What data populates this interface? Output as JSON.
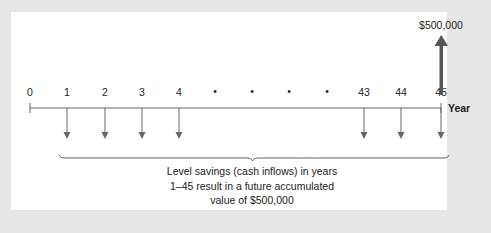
{
  "diagram": {
    "type": "cash-flow-timeline",
    "axis_label": "Year",
    "ticks": [
      {
        "label": "0",
        "x": 30,
        "kind": "number",
        "arrow": "none"
      },
      {
        "label": "1",
        "x": 67,
        "kind": "number",
        "arrow": "down"
      },
      {
        "label": "2",
        "x": 105,
        "kind": "number",
        "arrow": "down"
      },
      {
        "label": "3",
        "x": 142,
        "kind": "number",
        "arrow": "down"
      },
      {
        "label": "4",
        "x": 179,
        "kind": "number",
        "arrow": "down"
      },
      {
        "label": "•",
        "x": 215,
        "kind": "ellipsis",
        "arrow": "none"
      },
      {
        "label": "•",
        "x": 252,
        "kind": "ellipsis",
        "arrow": "none"
      },
      {
        "label": "•",
        "x": 289,
        "kind": "ellipsis",
        "arrow": "none"
      },
      {
        "label": "•",
        "x": 327,
        "kind": "ellipsis",
        "arrow": "none"
      },
      {
        "label": "43",
        "x": 364,
        "kind": "number",
        "arrow": "down"
      },
      {
        "label": "44",
        "x": 401,
        "kind": "number",
        "arrow": "down"
      },
      {
        "label": "45",
        "x": 441,
        "kind": "number",
        "arrow": "down"
      }
    ],
    "future_value": {
      "label": "$500,000",
      "year": "45",
      "direction": "up"
    },
    "caption_lines": [
      "Level savings (cash inflows) in years",
      "1–45 result in a future accumulated",
      "value of $500,000"
    ],
    "colors": {
      "background": "#e6e6e6",
      "panel": "#ffffff",
      "line": "#555555",
      "up_arrow": "#555555",
      "text": "#222222"
    }
  }
}
